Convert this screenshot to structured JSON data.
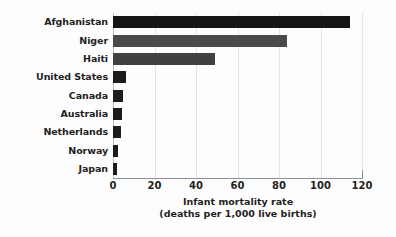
{
  "chart_data": {
    "type": "bar",
    "orientation": "horizontal",
    "title": "",
    "xlabel": "Infant mortality rate",
    "xlabel_sub": "(deaths per 1,000 live births)",
    "ylabel": "",
    "xlim": [
      0,
      120
    ],
    "xticks": [
      "0",
      "20",
      "40",
      "60",
      "80",
      "100",
      "120"
    ],
    "xtick_values": [
      0,
      20,
      40,
      60,
      80,
      100,
      120
    ],
    "grid": "vertical",
    "legend": "none",
    "categories": [
      "Afghanistan",
      "Niger",
      "Haiti",
      "United States",
      "Canada",
      "Australia",
      "Netherlands",
      "Norway",
      "Japan"
    ],
    "values": [
      114,
      84,
      49,
      6.3,
      5.0,
      4.5,
      3.8,
      2.5,
      2.1
    ],
    "bar_colors": [
      "#151515",
      "#4a4a4a",
      "#414141",
      "#1c1c1c",
      "#1c1c1c",
      "#1c1c1c",
      "#1c1c1c",
      "#1c1c1c",
      "#1c1c1c"
    ],
    "colors": {
      "background": "#fdfdfd",
      "gridline": "#e3e4e6",
      "axis": "#8d9094",
      "text": "#1f1f1f"
    }
  }
}
